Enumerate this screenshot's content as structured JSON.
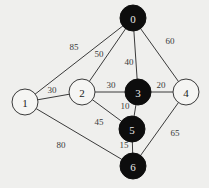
{
  "graph": {
    "colors": {
      "background": "#efefed",
      "visited_node_fill": "#0d0d0d",
      "unvisited_node_fill": "#f5f5f3",
      "edge": "#3a3a3a"
    },
    "nodes": [
      {
        "id": "0",
        "label": "0",
        "x": 133,
        "y": 18,
        "r": 13,
        "filled": true
      },
      {
        "id": "1",
        "label": "1",
        "x": 25,
        "y": 102,
        "r": 13,
        "filled": false
      },
      {
        "id": "2",
        "label": "2",
        "x": 82,
        "y": 92,
        "r": 13,
        "filled": false
      },
      {
        "id": "3",
        "label": "3",
        "x": 138,
        "y": 92,
        "r": 13,
        "filled": true
      },
      {
        "id": "4",
        "label": "4",
        "x": 186,
        "y": 92,
        "r": 13,
        "filled": false
      },
      {
        "id": "5",
        "label": "5",
        "x": 132,
        "y": 129,
        "r": 13,
        "filled": true
      },
      {
        "id": "6",
        "label": "6",
        "x": 133,
        "y": 166,
        "r": 13,
        "filled": true
      }
    ],
    "edges": [
      {
        "from": "1",
        "to": "0",
        "weight": "85",
        "lx": 74,
        "ly": 48
      },
      {
        "from": "2",
        "to": "0",
        "weight": "50",
        "lx": 99,
        "ly": 55
      },
      {
        "from": "0",
        "to": "3",
        "weight": "40",
        "lx": 129,
        "ly": 63
      },
      {
        "from": "0",
        "to": "4",
        "weight": "60",
        "lx": 170,
        "ly": 42
      },
      {
        "from": "1",
        "to": "2",
        "weight": "30",
        "lx": 52,
        "ly": 91
      },
      {
        "from": "2",
        "to": "3",
        "weight": "30",
        "lx": 111,
        "ly": 86
      },
      {
        "from": "3",
        "to": "4",
        "weight": "20",
        "lx": 161,
        "ly": 86
      },
      {
        "from": "3",
        "to": "5",
        "weight": "10",
        "lx": 125,
        "ly": 107
      },
      {
        "from": "2",
        "to": "5",
        "weight": "45",
        "lx": 99,
        "ly": 123
      },
      {
        "from": "5",
        "to": "6",
        "weight": "15",
        "lx": 124,
        "ly": 146
      },
      {
        "from": "1",
        "to": "6",
        "weight": "80",
        "lx": 61,
        "ly": 146
      },
      {
        "from": "4",
        "to": "6",
        "weight": "65",
        "lx": 175,
        "ly": 134
      }
    ]
  }
}
